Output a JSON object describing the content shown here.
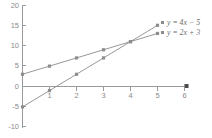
{
  "chart_data": {
    "type": "line",
    "title": "",
    "subtitle": "",
    "xlabel": "",
    "ylabel": "",
    "xlim": [
      -0.85,
      6.6
    ],
    "ylim": [
      -10,
      20
    ],
    "xticks": [
      1,
      2,
      3,
      4,
      5,
      6
    ],
    "yticks": [
      -10,
      -5,
      0,
      5,
      10,
      15,
      20
    ],
    "xtick_labels": [
      "1",
      "2",
      "3",
      "4",
      "5",
      "6"
    ],
    "ytick_labels": [
      "-10",
      "-5",
      "0",
      "5",
      "10",
      "15",
      "20"
    ],
    "grid": false,
    "legend_position": "right-top",
    "markers": "square",
    "line_color": "#8c8c8c",
    "axis_color": "#9a9a9a",
    "text_color": "#8a8a8a",
    "background": "#ffffff",
    "x": [
      0,
      1,
      2,
      3,
      4,
      5
    ],
    "series": [
      {
        "name": "y = 4x − 5",
        "equation": "y = 4x - 5",
        "slope": 4,
        "intercept": -5,
        "values": [
          -5,
          -1,
          3,
          7,
          11,
          15
        ]
      },
      {
        "name": "y = 2x + 3",
        "equation": "y = 2x + 3",
        "slope": 2,
        "intercept": 3,
        "values": [
          3,
          5,
          7,
          9,
          11,
          13
        ]
      }
    ],
    "annotations": [
      {
        "label": "intersection",
        "x": 4,
        "y": 11
      }
    ]
  },
  "legend": {
    "entries": [
      {
        "label": "y = 4x − 5"
      },
      {
        "label": "y = 2x + 3"
      }
    ]
  },
  "axes": {
    "x_tick_1": "1",
    "x_tick_2": "2",
    "x_tick_3": "3",
    "x_tick_4": "4",
    "x_tick_5": "5",
    "x_tick_6": "6",
    "y_tick_20": "20",
    "y_tick_15": "15",
    "y_tick_10": "10",
    "y_tick_5": "5",
    "y_tick_0": "0",
    "y_tick_neg5": "-5",
    "y_tick_neg10": "-10"
  }
}
